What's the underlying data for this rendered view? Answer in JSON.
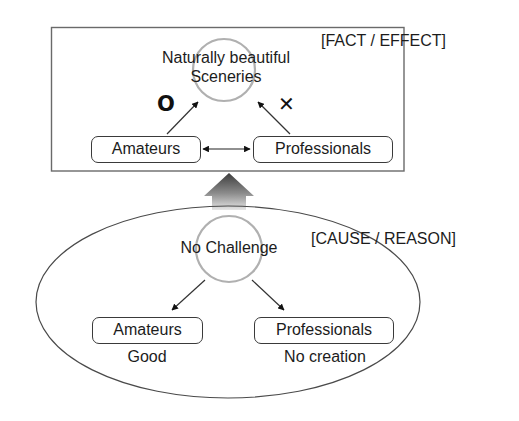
{
  "effect_box": {
    "label": "[FACT / EFFECT]",
    "target": "Naturally beautiful",
    "target_line2": "Sceneries",
    "nodes": [
      {
        "label": "Amateurs",
        "mark": "O"
      },
      {
        "label": "Professionals",
        "mark": "✕"
      }
    ]
  },
  "cause_ellipse": {
    "label": "[CAUSE / REASON]",
    "source": "No Challenge",
    "nodes": [
      {
        "label": "Amateurs",
        "result": "Good"
      },
      {
        "label": "Professionals",
        "result": "No creation"
      }
    ]
  },
  "colors": {
    "stroke": "#3a3a3a",
    "highlight_circle": "#b0b0b0",
    "arrow_dark": "#4a4a4a",
    "arrow_light": "#e2e2e2"
  }
}
